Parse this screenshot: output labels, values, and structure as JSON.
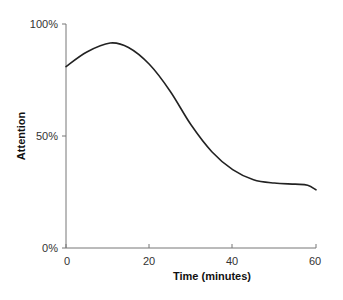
{
  "chart_data": {
    "type": "line",
    "title": "",
    "xlabel": "Time (minutes)",
    "ylabel": "Attention",
    "xlim": [
      0,
      60
    ],
    "ylim": [
      0,
      100
    ],
    "x_ticks": [
      0,
      20,
      40,
      60
    ],
    "x_tick_labels": [
      "0",
      "20",
      "40",
      "60"
    ],
    "y_ticks": [
      0,
      50,
      100
    ],
    "y_tick_labels": [
      "0%",
      "50%",
      "100%"
    ],
    "grid": false,
    "legend": null,
    "series": [
      {
        "name": "Attention",
        "color": "#222222",
        "x": [
          0,
          5,
          10.6,
          15,
          20,
          25,
          30,
          35,
          40,
          45,
          50,
          55,
          58,
          60
        ],
        "values": [
          81,
          87.5,
          91.5,
          89.5,
          82,
          70,
          55,
          43,
          35,
          30.5,
          29,
          28.5,
          28,
          26
        ]
      }
    ]
  }
}
